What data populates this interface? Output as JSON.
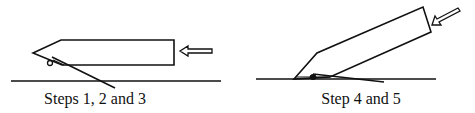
{
  "figure": {
    "panels": [
      {
        "id": "left",
        "caption": "Steps 1, 2 and 3",
        "description": "Pen-like object held horizontally, pushed from the right, with a flap/stick touching the ground line"
      },
      {
        "id": "right",
        "caption": "Step 4 and 5",
        "description": "Pen-like object tilted upward, pushed diagonally from the upper right, tip resting on ground"
      }
    ],
    "colors": {
      "stroke": "#111111",
      "background": "#ffffff"
    }
  }
}
